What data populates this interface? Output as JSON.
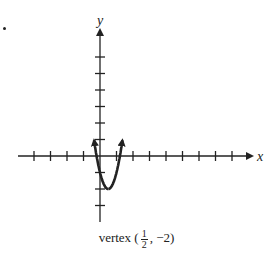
{
  "chart_data": {
    "type": "line",
    "title": "",
    "xlabel": "x",
    "ylabel": "y",
    "function": "y = 4(x - 1/2)^2 - 2",
    "vertex": {
      "x": 0.5,
      "y": -2
    },
    "xlim": [
      -5,
      9
    ],
    "ylim": [
      -4,
      7
    ],
    "x_ticks": [
      -4,
      -3,
      -2,
      -1,
      1,
      2,
      3,
      4,
      5,
      6,
      7,
      8
    ],
    "y_ticks": [
      -3,
      -2,
      -1,
      1,
      2,
      3,
      4,
      5,
      6
    ],
    "tick_labels_shown": false,
    "grid": false,
    "series": [
      {
        "name": "parabola",
        "x": [
          -0.4,
          -0.25,
          0,
          0.25,
          0.5,
          0.75,
          1,
          1.25,
          1.4
        ],
        "y": [
          1.24,
          0.25,
          -1,
          -1.75,
          -2,
          -1.75,
          -1,
          0.25,
          1.24
        ],
        "arrows_at_ends": true
      }
    ],
    "annotation": "vertex (1/2, -2)"
  },
  "caption": {
    "prefix": "vertex (",
    "frac_num": "1",
    "frac_den": "2",
    "suffix": ",  −2)"
  },
  "axes": {
    "x_label": "x",
    "y_label": "y"
  }
}
